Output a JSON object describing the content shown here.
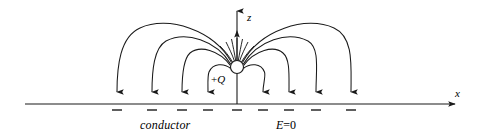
{
  "figure": {
    "type": "physics-field-line-diagram",
    "background_color": "#ffffff",
    "stroke_color": "#1a1a1a",
    "axes": {
      "x_axis_label": "x",
      "z_axis_label": "z",
      "x_axis_start_px": 25,
      "x_axis_end_px": 462,
      "x_axis_y_px": 104,
      "z_axis_x_px": 237,
      "z_axis_top_px": 6,
      "z_axis_bottom_px": 104,
      "z_axis_mid_arrow_y_px": 34
    },
    "charge": {
      "label_sign": "+",
      "label_symbol": "Q",
      "center_x_px": 237,
      "center_y_px": 67,
      "radius_px": 6.5
    },
    "labels": {
      "conductor": "conductor",
      "field_zero_prefix": "E",
      "field_zero_rest": "=0",
      "field_zero_full": "E=0"
    },
    "surface_charges": {
      "symbol": "–",
      "count": 9,
      "x_positions_px": [
        117,
        152,
        182,
        208,
        237,
        263,
        289,
        316,
        351
      ],
      "y_px": 110
    },
    "field_lines": {
      "arrow_landing_x_px": [
        117,
        152,
        182,
        208,
        237,
        263,
        289,
        316,
        351
      ],
      "left_count": 4,
      "right_count": 4,
      "vertical_center_line": true,
      "apex_heights_px": [
        22,
        42,
        58,
        72
      ]
    }
  }
}
